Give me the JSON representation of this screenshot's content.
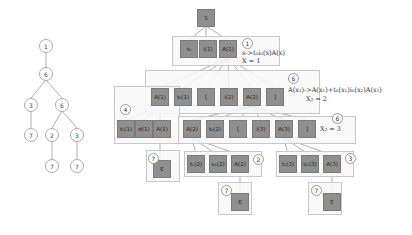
{
  "left_tree": {
    "nodes": [
      "1",
      "6",
      "3",
      "6",
      "7",
      "2",
      "3",
      "7",
      "7"
    ]
  },
  "parse_tree": {
    "root": "S",
    "level1": [
      "t₀",
      "i(1)",
      "A(1)"
    ],
    "level2": [
      "A(1)",
      "t₀(1)",
      "[",
      "i(2)",
      "A(2)",
      "]"
    ],
    "level3_left": [
      "t₁(1)",
      "d(1)",
      "A(1)"
    ],
    "level3_mid": [
      "A(2)",
      "t₀(2)",
      "[",
      "i(3)",
      "A(3)",
      "]"
    ],
    "level4_a": [
      "t₁(2)",
      "v₁(2)",
      "A(2)"
    ],
    "level4_b": [
      "t₁(3)",
      "o₁(3)",
      "A(3)"
    ],
    "leaf": "E"
  },
  "badges": {
    "b1": "1",
    "b6a": "6",
    "b4": "4",
    "b6b": "6",
    "b7a": "7",
    "b2": "2",
    "b3": "3",
    "b7b": "7",
    "b7c": "7"
  },
  "notes": {
    "rule1": "s->t₀i₀(x)A(x)",
    "x1": "X = 1",
    "rule2": "A(x₁)->A(x₁)+t₀(x₁)i₀(x₂)A(x₂)",
    "x2": "X₂ = 2",
    "x3": "X₂ = 3"
  }
}
